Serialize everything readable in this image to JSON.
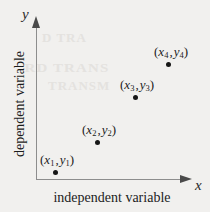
{
  "figure": {
    "background_color": "#f1f0ee",
    "axis_color": "#8d8d8d",
    "point_color": "#161616"
  },
  "axes": {
    "x_title": "independent variable",
    "y_title": "dependent variable",
    "x_symbol": "x",
    "y_symbol": "y"
  },
  "ghost_text": {
    "line1": "D TRA",
    "line2": "RD TRANS",
    "line3": "TRANSM"
  },
  "points": [
    {
      "label_var_x": "x",
      "label_sub_x": "1",
      "label_var_y": "y",
      "label_sub_y": "1",
      "open": "(",
      "close": ")",
      "sep": ","
    },
    {
      "label_var_x": "x",
      "label_sub_x": "2",
      "label_var_y": "y",
      "label_sub_y": "2",
      "open": "(",
      "close": ")",
      "sep": ","
    },
    {
      "label_var_x": "x",
      "label_sub_x": "3",
      "label_var_y": "y",
      "label_sub_y": "3",
      "open": "(",
      "close": ")",
      "sep": ","
    },
    {
      "label_var_x": "x",
      "label_sub_x": "4",
      "label_var_y": "y",
      "label_sub_y": "4",
      "open": "(",
      "close": ")",
      "sep": ","
    }
  ],
  "chart_data": {
    "type": "scatter",
    "title": "",
    "xlabel": "independent variable",
    "ylabel": "dependent variable",
    "x_symbol": "x",
    "y_symbol": "y",
    "grid": false,
    "legend": false,
    "axis_ticks": false,
    "xlim": [
      0,
      1
    ],
    "ylim": [
      0,
      1
    ],
    "point_labels": [
      "(x1 , y1)",
      "(x2 , y2)",
      "(x3 , y3)",
      "(x4 , y4)"
    ],
    "x": [
      0.125,
      0.401,
      0.651,
      0.868
    ],
    "y": [
      0.046,
      0.242,
      0.536,
      0.751
    ],
    "pixel_positions": [
      {
        "x": 55,
        "y": 172
      },
      {
        "x": 97,
        "y": 142
      },
      {
        "x": 135,
        "y": 97
      },
      {
        "x": 168,
        "y": 64
      }
    ],
    "label_pixel_positions": [
      {
        "x": 57,
        "y": 152
      },
      {
        "x": 99,
        "y": 122
      },
      {
        "x": 137,
        "y": 77
      },
      {
        "x": 171,
        "y": 44
      }
    ]
  }
}
